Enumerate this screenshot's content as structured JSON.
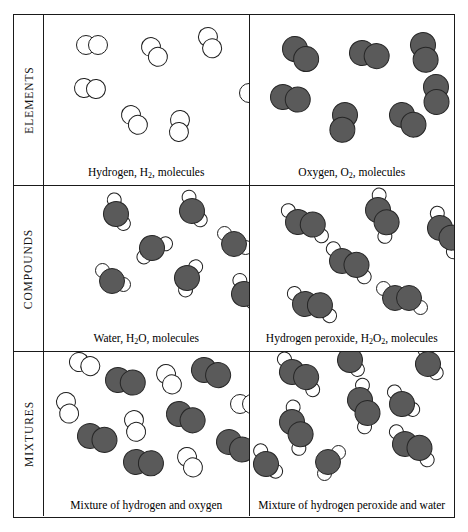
{
  "diagram": {
    "colors": {
      "oxygen_fill": "#5a5a5a",
      "oxygen_outline": "#262626",
      "hydrogen_fill": "#ffffff",
      "hydrogen_outline": "#1f1f1f",
      "frame": "#1a1a1a",
      "background": "#ffffff"
    },
    "rows": [
      {
        "label": "ELEMENTS",
        "cells": [
          {
            "caption_parts": [
              "Hydrogen, H",
              "2",
              ", molecules"
            ],
            "substance": "hydrogen",
            "formula": "H2",
            "molecule_count": 7,
            "molecules": [
              {
                "type": "H2",
                "x": 42,
                "y": 30,
                "rot": 0
              },
              {
                "type": "H2",
                "x": 107,
                "y": 32,
                "rot": 55
              },
              {
                "type": "H2",
                "x": 164,
                "y": 22,
                "rot": 70
              },
              {
                "type": "H2",
                "x": 40,
                "y": 73,
                "rot": 5
              },
              {
                "type": "H2",
                "x": 87,
                "y": 100,
                "rot": 55
              },
              {
                "type": "H2",
                "x": 136,
                "y": 105,
                "rot": 95
              },
              {
                "type": "H2",
                "x": 205,
                "y": 78,
                "rot": 0
              }
            ]
          },
          {
            "caption_parts": [
              "Oxygen, O",
              "2",
              ", molecules"
            ],
            "substance": "oxygen",
            "formula": "O2",
            "molecule_count": 7,
            "molecules": [
              {
                "type": "O2",
                "x": 45,
                "y": 34,
                "rot": 42
              },
              {
                "type": "O2",
                "x": 112,
                "y": 38,
                "rot": 12
              },
              {
                "type": "O2",
                "x": 173,
                "y": 30,
                "rot": 80
              },
              {
                "type": "O2",
                "x": 33,
                "y": 82,
                "rot": 10
              },
              {
                "type": "O2",
                "x": 186,
                "y": 72,
                "rot": 88
              },
              {
                "type": "O2",
                "x": 95,
                "y": 100,
                "rot": 100
              },
              {
                "type": "O2",
                "x": 152,
                "y": 100,
                "rot": 40
              }
            ]
          }
        ]
      },
      {
        "label": "COMPOUNDS",
        "cells": [
          {
            "caption_parts": [
              "Water, H",
              "2",
              "O, molecules"
            ],
            "substance": "water",
            "formula": "H2O",
            "molecule_count": 6,
            "molecules": [
              {
                "type": "H2O",
                "x": 72,
                "y": 28,
                "rot": 35
              },
              {
                "type": "H2O",
                "x": 148,
                "y": 25,
                "rot": 30
              },
              {
                "type": "H2O",
                "x": 108,
                "y": 62,
                "rot": 115
              },
              {
                "type": "H2O",
                "x": 190,
                "y": 58,
                "rot": 0
              },
              {
                "type": "H2O",
                "x": 68,
                "y": 95,
                "rot": 0
              },
              {
                "type": "H2O",
                "x": 143,
                "y": 92,
                "rot": 80
              },
              {
                "type": "H2O",
                "x": 200,
                "y": 108,
                "rot": 25
              }
            ]
          },
          {
            "caption_parts": [
              "Hydrogen peroxide, H",
              "2",
              "O",
              "2",
              ", molecules"
            ],
            "substance": "hydrogen peroxide",
            "formula": "H2O2",
            "molecule_count": 6,
            "molecules": [
              {
                "type": "H2O2",
                "x": 48,
                "y": 36,
                "rot": 10
              },
              {
                "type": "H2O2",
                "x": 128,
                "y": 24,
                "rot": 55
              },
              {
                "type": "H2O2",
                "x": 190,
                "y": 42,
                "rot": 40
              },
              {
                "type": "H2O2",
                "x": 92,
                "y": 75,
                "rot": 15
              },
              {
                "type": "H2O2",
                "x": 55,
                "y": 118,
                "rot": 5
              },
              {
                "type": "H2O2",
                "x": 145,
                "y": 112,
                "rot": 0
              }
            ]
          }
        ]
      },
      {
        "label": "MIXTURES",
        "cells": [
          {
            "caption_parts": [
              "Mixture of hydrogen and oxygen"
            ],
            "substance": "mixture of hydrogen and oxygen",
            "molecule_count": 12,
            "molecules": [
              {
                "type": "H2",
                "x": 35,
                "y": 10,
                "rot": 20
              },
              {
                "type": "O2",
                "x": 74,
                "y": 28,
                "rot": 10
              },
              {
                "type": "H2",
                "x": 122,
                "y": 22,
                "rot": 60
              },
              {
                "type": "O2",
                "x": 160,
                "y": 18,
                "rot": 20
              },
              {
                "type": "H2",
                "x": 22,
                "y": 50,
                "rot": 75
              },
              {
                "type": "H2",
                "x": 90,
                "y": 68,
                "rot": 80
              },
              {
                "type": "O2",
                "x": 135,
                "y": 62,
                "rot": 25
              },
              {
                "type": "H2",
                "x": 196,
                "y": 52,
                "rot": 0
              },
              {
                "type": "O2",
                "x": 46,
                "y": 84,
                "rot": 15
              },
              {
                "type": "O2",
                "x": 185,
                "y": 90,
                "rot": 30
              },
              {
                "type": "O2",
                "x": 92,
                "y": 110,
                "rot": 5
              },
              {
                "type": "H2",
                "x": 143,
                "y": 105,
                "rot": 60
              }
            ]
          },
          {
            "caption_parts": [
              "Mixture of hydrogen peroxide and water"
            ],
            "substance": "mixture of hydrogen peroxide and water",
            "molecule_count": 10,
            "molecules": [
              {
                "type": "H2O2",
                "x": 42,
                "y": 20,
                "rot": 20
              },
              {
                "type": "H2O",
                "x": 100,
                "y": 8,
                "rot": 35
              },
              {
                "type": "H2O",
                "x": 178,
                "y": 12,
                "rot": 30
              },
              {
                "type": "H2O2",
                "x": 110,
                "y": 48,
                "rot": 60
              },
              {
                "type": "H2O",
                "x": 152,
                "y": 52,
                "rot": 10
              },
              {
                "type": "H2O2",
                "x": 42,
                "y": 70,
                "rot": 55
              },
              {
                "type": "H2O2",
                "x": 155,
                "y": 92,
                "rot": 15
              },
              {
                "type": "H2O",
                "x": 16,
                "y": 112,
                "rot": 20
              },
              {
                "type": "H2O",
                "x": 78,
                "y": 110,
                "rot": 90
              }
            ]
          }
        ]
      }
    ]
  }
}
